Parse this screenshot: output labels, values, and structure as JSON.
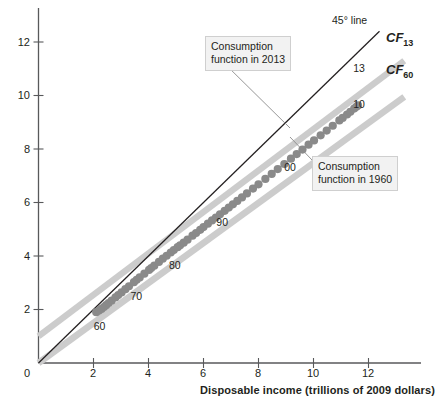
{
  "chart_data": {
    "type": "scatter",
    "title": "",
    "xlabel": "Disposable income (trillions of 2009 dollars)",
    "ylabel": "",
    "xlim": [
      0,
      13.5
    ],
    "ylim": [
      0,
      13.2
    ],
    "xticks": [
      0,
      2,
      4,
      6,
      8,
      10,
      12
    ],
    "xticklabels": [
      "0",
      "2",
      "4",
      "6",
      "8",
      "10",
      "12"
    ],
    "yticks": [
      0,
      2,
      4,
      6,
      8,
      10,
      12
    ],
    "yticklabels": [
      "0",
      "2",
      "4",
      "6",
      "8",
      "10",
      "12"
    ],
    "grid": false,
    "legend": "none",
    "point_color": "#8a8a8a",
    "cf13_color": "#cccccc",
    "cf60_color": "#cccccc",
    "line45_color": "#231f20",
    "axis_color": "#58595b",
    "series": [
      {
        "name": "Consumption vs disposable income",
        "type": "scatter",
        "x": [
          2.1,
          2.2,
          2.29,
          2.38,
          2.46,
          2.55,
          2.66,
          2.8,
          2.9,
          3.02,
          3.16,
          3.29,
          3.47,
          3.57,
          3.68,
          3.85,
          4.02,
          4.1,
          4.21,
          4.38,
          4.52,
          4.66,
          4.81,
          4.92,
          5.06,
          5.15,
          5.28,
          5.42,
          5.6,
          5.73,
          5.88,
          6.0,
          6.16,
          6.31,
          6.45,
          6.6,
          6.77,
          6.92,
          7.07,
          7.23,
          7.4,
          7.58,
          7.8,
          8.0,
          8.25,
          8.48,
          8.7,
          8.94,
          9.18,
          9.39,
          9.6,
          9.82,
          10.02,
          10.26,
          10.48,
          10.7,
          10.94,
          11.06,
          11.22,
          11.34,
          11.48,
          11.56,
          11.62
        ],
        "y": [
          1.9,
          1.96,
          2.02,
          2.09,
          2.16,
          2.24,
          2.33,
          2.45,
          2.54,
          2.64,
          2.76,
          2.87,
          3.02,
          3.11,
          3.2,
          3.34,
          3.48,
          3.55,
          3.64,
          3.78,
          3.9,
          4.01,
          4.13,
          4.22,
          4.33,
          4.4,
          4.5,
          4.61,
          4.76,
          4.86,
          4.98,
          5.08,
          5.21,
          5.33,
          5.44,
          5.56,
          5.69,
          5.81,
          5.93,
          6.06,
          6.19,
          6.34,
          6.52,
          6.68,
          6.88,
          7.07,
          7.25,
          7.44,
          7.64,
          7.81,
          7.98,
          8.16,
          8.32,
          8.51,
          8.69,
          8.87,
          9.07,
          9.16,
          9.29,
          9.39,
          9.51,
          9.58,
          9.63
        ]
      },
      {
        "name": "CF13",
        "type": "line",
        "x": [
          0.0,
          13.3
        ],
        "y": [
          1.0,
          11.3
        ]
      },
      {
        "name": "CF60",
        "type": "line",
        "x": [
          0.0,
          13.3
        ],
        "y": [
          0.0,
          9.95
        ]
      },
      {
        "name": "45 degree line",
        "type": "line",
        "x": [
          0.0,
          12.4
        ],
        "y": [
          0.0,
          12.4
        ]
      }
    ],
    "point_labels": [
      {
        "text": "60",
        "x": 2.26,
        "y": 1.33
      },
      {
        "text": "70",
        "x": 3.6,
        "y": 2.48
      },
      {
        "text": "80",
        "x": 5.0,
        "y": 3.62
      },
      {
        "text": "90",
        "x": 6.72,
        "y": 5.22
      },
      {
        "text": "00",
        "x": 9.19,
        "y": 7.28
      },
      {
        "text": "10",
        "x": 11.7,
        "y": 9.65
      },
      {
        "text": "13",
        "x": 11.7,
        "y": 10.98
      }
    ],
    "annotations": [
      {
        "name": "consumption-function-2013",
        "lines": [
          "Consumption",
          "function in 2013"
        ],
        "box_x": 205,
        "box_y": 36,
        "leader_from": [
          224,
          63
        ],
        "leader_to": [
          290,
          128
        ]
      },
      {
        "name": "consumption-function-1960",
        "lines": [
          "Consumption",
          "function in 1960"
        ],
        "box_x": 312,
        "box_y": 156,
        "leader_from": [
          312,
          160
        ],
        "leader_to": [
          290,
          137
        ]
      }
    ],
    "series_labels": [
      {
        "name": "line45",
        "text": "45° line",
        "x": 332,
        "y": 19
      },
      {
        "name": "cf13",
        "base": "CF",
        "sub": "13",
        "x": 386,
        "y": 36
      },
      {
        "name": "cf60",
        "base": "CF",
        "sub": "60",
        "x": 386,
        "y": 68
      }
    ]
  }
}
